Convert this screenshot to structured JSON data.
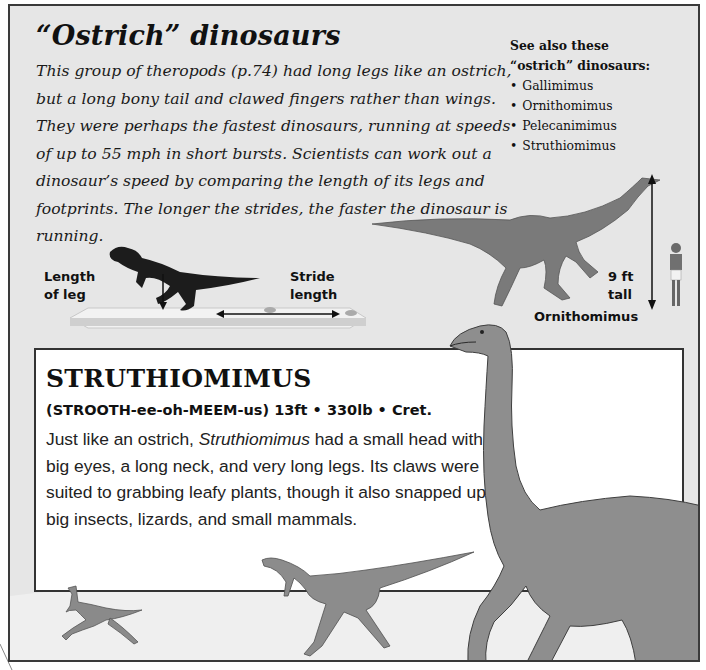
{
  "header": {
    "title": "“Ostrich” dinosaurs",
    "intro": "This group of theropods (p.74) had long legs like an ostrich, but a long bony tail and clawed fingers rather than wings. They were perhaps the fastest dinosaurs, running at speeds of up to 55 mph in short bursts. Scientists can work out a dinosaur’s speed by comparing the length of its legs and footprints. The longer the strides, the faster the dinosaur is running."
  },
  "see_also": {
    "heading_line1": "See also these",
    "heading_line2": "“ostrich” dinosaurs:",
    "items": [
      "Gallimimus",
      "Ornithomimus",
      "Pelecanimimus",
      "Struthiomimus"
    ]
  },
  "stride_diagram": {
    "leg_label_line1": "Length",
    "leg_label_line2": "of leg",
    "stride_label_line1": "Stride",
    "stride_label_line2": "length"
  },
  "scale_diagram": {
    "height_line1": "9 ft",
    "height_line2": "tall",
    "species_label": "Ornithomimus"
  },
  "infobox": {
    "name": "STRUTHIOMIMUS",
    "stats": "(STROOTH-ee-oh-MEEM-us) 13ft • 330lb • Cret.",
    "desc_before": "Just like an ostrich, ",
    "desc_italic": "Struthiomimus",
    "desc_after": " had a small head with big eyes, a long neck, and very long legs. Its claws were suited to grabbing leafy plants, though it also snapped up big insects, lizards, and small mammals."
  },
  "colors": {
    "page_bg": "#e6e6e6",
    "border": "#3a3a3a",
    "text": "#111111",
    "infobox_bg": "#ffffff"
  }
}
